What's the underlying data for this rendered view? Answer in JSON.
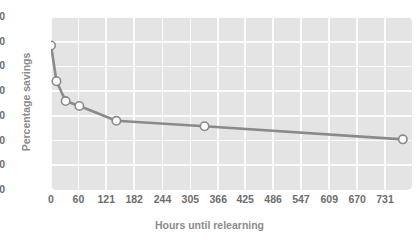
{
  "chart_data": {
    "type": "line",
    "title": "",
    "xlabel": "Hours until relearning",
    "ylabel": "Percentage savings",
    "xlim": [
      0,
      790
    ],
    "ylim": [
      0,
      70
    ],
    "grid": true,
    "legend": null,
    "xticks": [
      "0",
      "60",
      "121",
      "182",
      "244",
      "305",
      "366",
      "425",
      "486",
      "547",
      "609",
      "670",
      "731"
    ],
    "xtick_values": [
      0,
      60,
      121,
      182,
      244,
      305,
      366,
      425,
      486,
      547,
      609,
      670,
      731
    ],
    "yticks": [
      "0",
      "10",
      "20",
      "30",
      "40",
      "50",
      "60",
      "70"
    ],
    "ytick_values": [
      0,
      10,
      20,
      30,
      40,
      50,
      60,
      70
    ],
    "series": [
      {
        "name": "Savings",
        "x": [
          0,
          12,
          32,
          62,
          143,
          336,
          770
        ],
        "y": [
          58.5,
          44.0,
          36.0,
          34.0,
          28.0,
          25.8,
          20.5
        ],
        "marker": "open-circle",
        "line_color": "#8a8a8a",
        "marker_fill": "#ffffff",
        "marker_edge": "#8a8a8a"
      }
    ],
    "colors": {
      "plot_background": "#e4e4e4",
      "gridline": "#fbfbfb",
      "page_background": "#ffffff",
      "tick_text": "#6d6d6d",
      "axis_title_text": "#8c8c8c",
      "line": "#8a8a8a"
    }
  }
}
